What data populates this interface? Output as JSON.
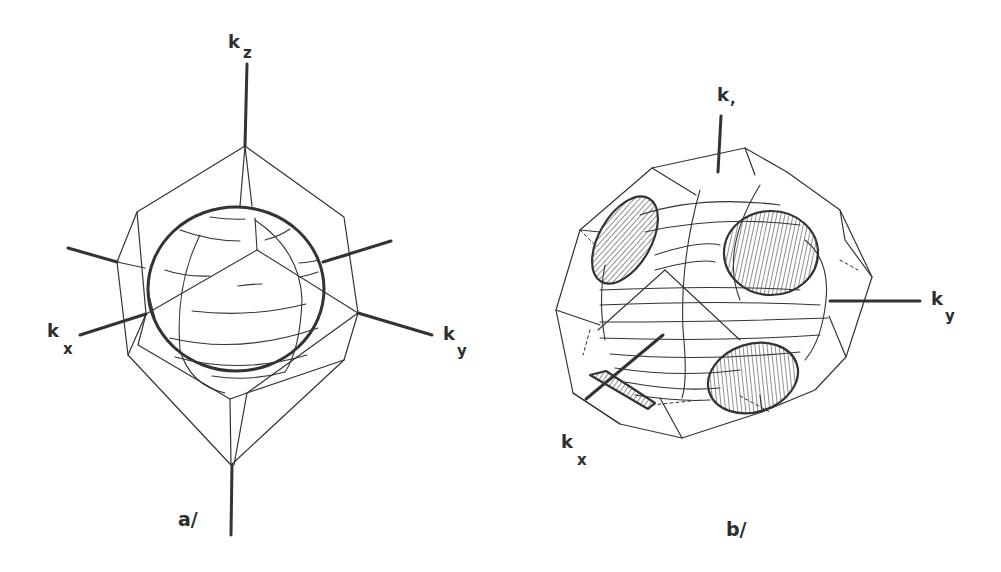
{
  "figure": {
    "panels": [
      {
        "id": "a",
        "label": "a/",
        "description": "Spherical Fermi surface inscribed in truncated-octahedron Brillouin zone",
        "axes": {
          "kz": {
            "main": "k",
            "sub": "z"
          },
          "kx": {
            "main": "k",
            "sub": "x"
          },
          "ky": {
            "main": "k",
            "sub": "y"
          }
        }
      },
      {
        "id": "b",
        "label": "b/",
        "description": "Distorted Fermi surface with hatched necks contacting hexagonal zone faces",
        "axes": {
          "kz": {
            "main": "k",
            "sub": ","
          },
          "kx": {
            "main": "k",
            "sub": "x"
          },
          "ky": {
            "main": "k",
            "sub": "y"
          }
        }
      }
    ],
    "colors": {
      "background": "#ffffff",
      "ink": "#2e2e2e",
      "hatch": "#444444"
    }
  }
}
